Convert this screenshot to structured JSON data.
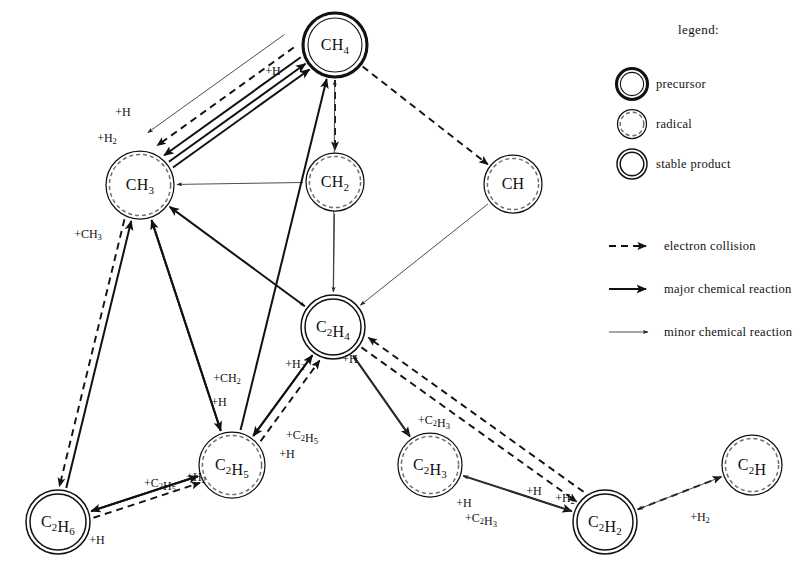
{
  "figure": {
    "kind": "reaction-pathway-graph",
    "background_color": "#ffffff",
    "ink_color": "#111111"
  },
  "legend": {
    "title": "legend:",
    "node_types": [
      {
        "key": "precursor",
        "label": "precursor",
        "ring": "thick-double"
      },
      {
        "key": "radical",
        "label": "radical",
        "ring": "dashed-inner"
      },
      {
        "key": "stable_product",
        "label": "stable product",
        "ring": "double"
      }
    ],
    "edge_types": [
      {
        "key": "electron",
        "label": "electron collision",
        "style": "dashed-arrow"
      },
      {
        "key": "major",
        "label": "major chemical reaction",
        "style": "thick-solid-arrow"
      },
      {
        "key": "minor",
        "label": "minor chemical reaction",
        "style": "thin-solid-arrow"
      }
    ]
  },
  "chart_data": {
    "type": "diagram",
    "title": "",
    "nodes": [
      {
        "id": "CH4",
        "base": "CH",
        "sub": "4",
        "type": "precursor",
        "x": 335,
        "y": 45,
        "r": 32
      },
      {
        "id": "CH3",
        "base": "CH",
        "sub": "3",
        "type": "radical",
        "x": 140,
        "y": 185,
        "r": 34
      },
      {
        "id": "CH2",
        "base": "CH",
        "sub": "2",
        "type": "radical",
        "x": 335,
        "y": 182,
        "r": 29
      },
      {
        "id": "CH",
        "base": "CH",
        "sub": "",
        "type": "radical",
        "x": 513,
        "y": 184,
        "r": 29
      },
      {
        "id": "C2H4",
        "base": "C",
        "sub": "2",
        "base2": "H",
        "sub2": "4",
        "type": "stable_product",
        "x": 333,
        "y": 327,
        "r": 32
      },
      {
        "id": "C2H5",
        "base": "C",
        "sub": "2",
        "base2": "H",
        "sub2": "5",
        "type": "radical",
        "x": 232,
        "y": 465,
        "r": 33
      },
      {
        "id": "C2H6",
        "base": "C",
        "sub": "2",
        "base2": "H",
        "sub2": "6",
        "type": "stable_product",
        "x": 58,
        "y": 522,
        "r": 32
      },
      {
        "id": "C2H3",
        "base": "C",
        "sub": "2",
        "base2": "H",
        "sub2": "3",
        "type": "radical",
        "x": 430,
        "y": 465,
        "r": 32
      },
      {
        "id": "C2H2",
        "base": "C",
        "sub": "2",
        "base2": "H",
        "sub2": "2",
        "type": "stable_product",
        "x": 605,
        "y": 522,
        "r": 32
      },
      {
        "id": "C2H",
        "base": "C",
        "sub": "2",
        "base2": "H",
        "sub2": "",
        "type": "radical",
        "x": 752,
        "y": 465,
        "r": 30
      }
    ],
    "edges": [
      {
        "from": "CH3",
        "to": "CH4",
        "kind": "major",
        "label": "",
        "offset": 5
      },
      {
        "from": "CH3",
        "to": "CH4",
        "kind": "major",
        "label": "",
        "offset": -2
      },
      {
        "from": "CH4",
        "to": "CH3",
        "kind": "major",
        "label": "",
        "offset": 10
      },
      {
        "from": "CH4",
        "to": "CH3",
        "kind": "electron",
        "label": "",
        "offset": 22
      },
      {
        "from": "CH4",
        "to": "CH2",
        "kind": "electron",
        "label": "",
        "offset": 0
      },
      {
        "from": "CH4",
        "to": "CH",
        "kind": "electron",
        "label": "",
        "offset": 0
      },
      {
        "from": "CH4",
        "to": "CH3",
        "kind": "minor",
        "label": "",
        "offset": 38
      },
      {
        "from": "CH2",
        "to": "CH3",
        "kind": "minor",
        "label": "",
        "offset": 0
      },
      {
        "from": "CH2",
        "to": "C2H4",
        "kind": "minor",
        "label": "",
        "offset": 0
      },
      {
        "from": "CH",
        "to": "C2H4",
        "kind": "minor",
        "label": "",
        "offset": 0
      },
      {
        "from": "CH3",
        "to": "C2H4",
        "kind": "minor",
        "label": "",
        "offset": 0
      },
      {
        "from": "C2H5",
        "to": "CH4",
        "kind": "major",
        "label": "",
        "offset": 0
      },
      {
        "from": "C2H4",
        "to": "CH4",
        "kind": "minor",
        "label": "",
        "offset": 0
      },
      {
        "from": "C2H6",
        "to": "CH3",
        "kind": "major",
        "label": "+CH3",
        "offset": 0
      },
      {
        "from": "CH3",
        "to": "C2H6",
        "kind": "electron",
        "label": "",
        "offset": 7
      },
      {
        "from": "C2H5",
        "to": "CH3",
        "kind": "major",
        "label": "",
        "offset": 0
      },
      {
        "from": "C2H4",
        "to": "CH3",
        "kind": "major",
        "label": "",
        "offset": 0
      },
      {
        "from": "CH3",
        "to": "C2H5",
        "kind": "major",
        "label": "+CH2 / +H",
        "offset": 0
      },
      {
        "from": "C2H5",
        "to": "C2H4",
        "kind": "major",
        "label": "+H2",
        "offset": 0
      },
      {
        "from": "C2H4",
        "to": "C2H5",
        "kind": "major",
        "label": "+C2H5 / +H",
        "offset": 0
      },
      {
        "from": "C2H5",
        "to": "C2H4",
        "kind": "electron",
        "label": "",
        "offset": 9
      },
      {
        "from": "C2H4",
        "to": "C2H3",
        "kind": "major",
        "label": "+C2H3",
        "offset": 0
      },
      {
        "from": "C2H3",
        "to": "C2H4",
        "kind": "minor",
        "label": "+H",
        "offset": 0
      },
      {
        "from": "C2H4",
        "to": "C2H2",
        "kind": "electron",
        "label": "",
        "offset": 0
      },
      {
        "from": "C2H2",
        "to": "C2H4",
        "kind": "electron",
        "label": "",
        "offset": 12
      },
      {
        "from": "C2H5",
        "to": "C2H6",
        "kind": "major",
        "label": "+C2H5 / +H2",
        "offset": 0
      },
      {
        "from": "C2H6",
        "to": "C2H5",
        "kind": "major",
        "label": "+H",
        "offset": 0
      },
      {
        "from": "C2H6",
        "to": "C2H5",
        "kind": "electron",
        "label": "",
        "offset": 7
      },
      {
        "from": "C2H3",
        "to": "C2H2",
        "kind": "major",
        "label": "+H / +C2H3",
        "offset": 0
      },
      {
        "from": "C2H2",
        "to": "C2H3",
        "kind": "minor",
        "label": "+H / +H2",
        "offset": 0
      },
      {
        "from": "C2H2",
        "to": "C2H",
        "kind": "electron",
        "label": "",
        "offset": 0
      },
      {
        "from": "C2H",
        "to": "C2H2",
        "kind": "minor",
        "label": "+H2",
        "offset": 0
      }
    ],
    "edge_labels": [
      {
        "text": "+H",
        "x": 273,
        "y": 72
      },
      {
        "text": "+H",
        "x": 123,
        "y": 113
      },
      {
        "text": "+H2",
        "x": 107,
        "y": 139
      },
      {
        "text": "+CH3",
        "x": 88,
        "y": 235
      },
      {
        "text": "+CH2",
        "x": 227,
        "y": 379
      },
      {
        "text": "+H",
        "x": 219,
        "y": 403
      },
      {
        "text": "+H2",
        "x": 295,
        "y": 365
      },
      {
        "text": "+H",
        "x": 350,
        "y": 360
      },
      {
        "text": "+C2H5",
        "x": 302,
        "y": 436
      },
      {
        "text": "+H",
        "x": 287,
        "y": 455
      },
      {
        "text": "+C2H3",
        "x": 434,
        "y": 421
      },
      {
        "text": "+C2H5",
        "x": 160,
        "y": 484
      },
      {
        "text": "+H2",
        "x": 196,
        "y": 478
      },
      {
        "text": "+H",
        "x": 97,
        "y": 541
      },
      {
        "text": "+H",
        "x": 464,
        "y": 504
      },
      {
        "text": "+C2H3",
        "x": 481,
        "y": 519
      },
      {
        "text": "+H",
        "x": 534,
        "y": 492
      },
      {
        "text": "+H2",
        "x": 565,
        "y": 499
      },
      {
        "text": "+H2",
        "x": 700,
        "y": 518
      }
    ],
    "node_type_meanings": {
      "precursor": "CH4",
      "radicals": [
        "CH3",
        "CH2",
        "CH",
        "C2H5",
        "C2H3",
        "C2H"
      ],
      "stable_products": [
        "C2H4",
        "C2H6",
        "C2H2"
      ]
    }
  }
}
